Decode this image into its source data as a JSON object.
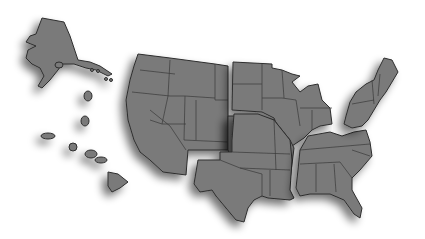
{
  "image": {
    "description": "Grayscale illustration of the United States map split into regional pieces with drop shadows",
    "fill_color": "#7a7a7a",
    "stroke_color": "#2e2e2e",
    "background_color": "#ffffff",
    "regions": [
      {
        "id": "alaska",
        "label": "Alaska"
      },
      {
        "id": "hawaii",
        "label": "Hawaii"
      },
      {
        "id": "west",
        "label": "Western States"
      },
      {
        "id": "northern-plains",
        "label": "Northern Plains & Great Lakes"
      },
      {
        "id": "south-central",
        "label": "South Central States"
      },
      {
        "id": "southeast",
        "label": "Southeastern States"
      },
      {
        "id": "northeast",
        "label": "Northeastern States"
      }
    ]
  }
}
